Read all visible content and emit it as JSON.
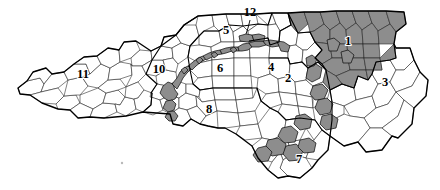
{
  "map": {
    "title": "North Carolina Congressional Districts",
    "state": "North Carolina",
    "background_color": "#ffffff",
    "shaded_fill": "#8d8d8d",
    "unshaded_fill": "#ffffff",
    "outline_color": "#000000",
    "districts": [
      {
        "id": "1",
        "label": "1",
        "shaded": true,
        "label_x": 348,
        "label_y": 42,
        "region": "northeast"
      },
      {
        "id": "2",
        "label": "2",
        "shaded": false,
        "label_x": 288,
        "label_y": 79,
        "region": "central-east"
      },
      {
        "id": "3",
        "label": "3",
        "shaded": false,
        "label_x": 385,
        "label_y": 83,
        "region": "coastal-east"
      },
      {
        "id": "4",
        "label": "4",
        "shaded": false,
        "label_x": 271,
        "label_y": 68,
        "region": "raleigh-durham"
      },
      {
        "id": "5",
        "label": "5",
        "shaded": false,
        "label_x": 226,
        "label_y": 31,
        "region": "north-central"
      },
      {
        "id": "6",
        "label": "6",
        "shaded": false,
        "label_x": 220,
        "label_y": 69,
        "region": "piedmont-triad"
      },
      {
        "id": "7",
        "label": "7",
        "shaded": false,
        "label_x": 299,
        "label_y": 160,
        "region": "southeast"
      },
      {
        "id": "8",
        "label": "8",
        "shaded": false,
        "label_x": 209,
        "label_y": 110,
        "region": "south-central"
      },
      {
        "id": "10",
        "label": "10",
        "shaded": false,
        "label_x": 159,
        "label_y": 70,
        "region": "west-piedmont"
      },
      {
        "id": "11",
        "label": "11",
        "shaded": false,
        "label_x": 83,
        "label_y": 75,
        "region": "far-west-mountains"
      },
      {
        "id": "12",
        "label": "12",
        "shaded": true,
        "label_x": 250,
        "label_y": 13,
        "region": "i-85-corridor",
        "has_leader_line": true
      }
    ],
    "legend_note": ""
  }
}
